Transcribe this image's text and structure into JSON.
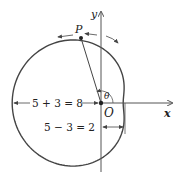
{
  "diagram": {
    "type": "polar-limacon",
    "equation_hint": "r = 5 - 3 cos θ",
    "labels": {
      "y_axis": "y",
      "x_axis": "x",
      "origin": "O",
      "point": "P",
      "angle": "θ",
      "left_distance": "5 + 3 = 8",
      "right_distance": "5 − 3 = 2"
    },
    "colors": {
      "curve": "#444444",
      "axes": "#555555",
      "text": "#222222"
    }
  }
}
